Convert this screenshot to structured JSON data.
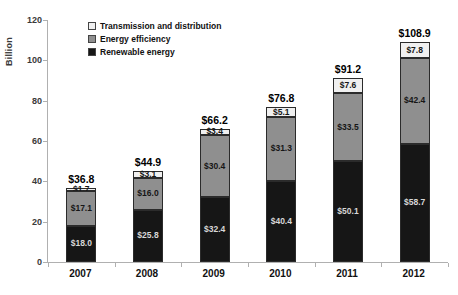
{
  "chart_data": {
    "type": "bar",
    "stacked": true,
    "title": "",
    "ylabel": "Billion",
    "xlabel": "",
    "ylim": [
      0,
      120
    ],
    "yticks": [
      0,
      20,
      40,
      60,
      80,
      100,
      120
    ],
    "grid": false,
    "legend_position": "top-left-inside",
    "categories": [
      "2007",
      "2008",
      "2009",
      "2010",
      "2011",
      "2012"
    ],
    "series": [
      {
        "name": "Renewable energy",
        "color": "#161616",
        "label_color": "#d8d8d8",
        "values": [
          18.0,
          25.8,
          32.4,
          40.4,
          50.1,
          58.7
        ],
        "labels": [
          "$18.0",
          "$25.8",
          "$32.4",
          "$40.4",
          "$50.1",
          "$58.7"
        ]
      },
      {
        "name": "Energy efficiency",
        "color": "#8f8f8f",
        "label_color": "#161616",
        "values": [
          17.1,
          16.0,
          30.4,
          31.3,
          33.5,
          42.4
        ],
        "labels": [
          "$17.1",
          "$16.0",
          "$30.4",
          "$31.3",
          "$33.5",
          "$42.4"
        ]
      },
      {
        "name": "Transmission and distribution",
        "color": "#f0f0f0",
        "label_color": "#161616",
        "values": [
          1.7,
          3.1,
          3.4,
          5.1,
          7.6,
          7.8
        ],
        "labels": [
          "$1.7",
          "$3.1",
          "$3.4",
          "$5.1",
          "$7.6",
          "$7.8"
        ]
      }
    ],
    "totals": [
      36.8,
      44.9,
      66.2,
      76.8,
      91.2,
      108.9
    ],
    "totals_display": [
      "$36.8",
      "$44.9",
      "$66.2",
      "$76.8",
      "$91.2",
      "$108.9"
    ],
    "legend": [
      {
        "label": "Transmission and distribution",
        "color": "#f0f0f0"
      },
      {
        "label": "Energy efficiency",
        "color": "#8f8f8f"
      },
      {
        "label": "Renewable energy",
        "color": "#161616"
      }
    ]
  }
}
